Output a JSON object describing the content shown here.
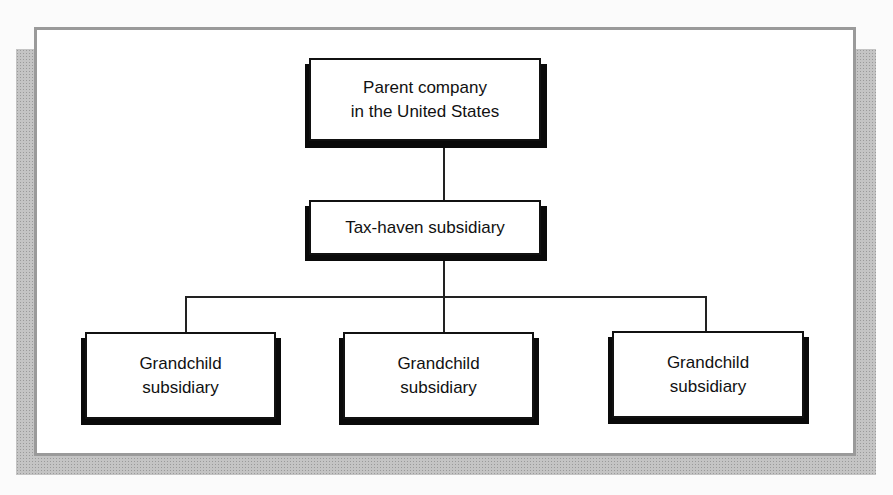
{
  "diagram": {
    "type": "org-chart",
    "nodes": {
      "parent": {
        "line1": "Parent company",
        "line2": "in the United States"
      },
      "tax_haven": {
        "label": "Tax-haven subsidiary"
      },
      "grandchildren": [
        {
          "line1": "Grandchild",
          "line2": "subsidiary"
        },
        {
          "line1": "Grandchild",
          "line2": "subsidiary"
        },
        {
          "line1": "Grandchild",
          "line2": "subsidiary"
        }
      ]
    },
    "edges": [
      [
        "parent",
        "tax_haven"
      ],
      [
        "tax_haven",
        "grandchild_1"
      ],
      [
        "tax_haven",
        "grandchild_2"
      ],
      [
        "tax_haven",
        "grandchild_3"
      ]
    ],
    "colors": {
      "box_border": "#111111",
      "box_shadow": "#0a0a0a",
      "frame_border": "#9a9a9a",
      "backdrop_shadow": "#c4c4c4"
    }
  }
}
